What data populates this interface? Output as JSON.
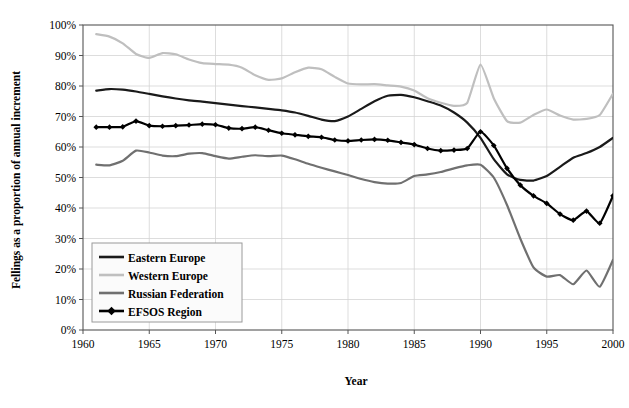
{
  "chart_data": {
    "type": "line",
    "title": "",
    "xlabel": "Year",
    "ylabel": "Fellings as a proportion of annual increment",
    "xlim": [
      1960,
      2000
    ],
    "ylim": [
      0,
      100
    ],
    "xticks": [
      1960,
      1965,
      1970,
      1975,
      1980,
      1985,
      1990,
      1995,
      2000
    ],
    "xtick_labels": [
      "1960",
      "1965",
      "1970",
      "1975",
      "1980",
      "1985",
      "1990",
      "1995",
      "2000"
    ],
    "yticks": [
      0,
      10,
      20,
      30,
      40,
      50,
      60,
      70,
      80,
      90,
      100
    ],
    "ytick_labels": [
      "0%",
      "10%",
      "20%",
      "30%",
      "40%",
      "50%",
      "60%",
      "70%",
      "80%",
      "90%",
      "100%"
    ],
    "grid": "horizontal-and-vertical-light",
    "legend_position": "lower-left-inside",
    "x": [
      1961,
      1962,
      1963,
      1964,
      1965,
      1966,
      1967,
      1968,
      1969,
      1970,
      1971,
      1972,
      1973,
      1974,
      1975,
      1976,
      1977,
      1978,
      1979,
      1980,
      1981,
      1982,
      1983,
      1984,
      1985,
      1986,
      1987,
      1988,
      1989,
      1990,
      1991,
      1992,
      1993,
      1994,
      1995,
      1996,
      1997,
      1998,
      1999,
      2000
    ],
    "series": [
      {
        "name": "Eastern Europe",
        "color": "#1a1a1a",
        "width": 2.2,
        "marker": "none",
        "values": [
          78.5,
          79.0,
          78.8,
          78.2,
          77.4,
          76.6,
          75.9,
          75.3,
          74.9,
          74.4,
          73.9,
          73.4,
          73.0,
          72.5,
          72.0,
          71.3,
          70.2,
          69.0,
          68.5,
          70.0,
          72.5,
          75.0,
          76.8,
          77.1,
          76.3,
          75.0,
          73.6,
          71.3,
          68.0,
          63.0,
          56.0,
          51.0,
          49.2,
          49.0,
          50.5,
          53.5,
          56.5,
          58.0,
          60.0,
          63.0
        ]
      },
      {
        "name": "Western Europe",
        "color": "#bfbfbf",
        "width": 2.2,
        "marker": "none",
        "values": [
          97.0,
          96.2,
          94.0,
          90.5,
          89.2,
          90.8,
          90.4,
          88.7,
          87.5,
          87.2,
          87.0,
          86.0,
          83.5,
          82.0,
          82.5,
          84.5,
          86.0,
          85.5,
          83.0,
          80.8,
          80.5,
          80.6,
          80.2,
          79.8,
          78.5,
          76.0,
          74.5,
          73.5,
          74.5,
          87.0,
          76.0,
          68.5,
          68.0,
          70.5,
          72.3,
          70.3,
          69.0,
          69.2,
          70.5,
          77.5
        ]
      },
      {
        "name": "Russian Federation",
        "color": "#707070",
        "width": 2.2,
        "marker": "none",
        "values": [
          54.2,
          54.0,
          55.5,
          58.8,
          58.2,
          57.2,
          57.0,
          57.8,
          58.0,
          57.0,
          56.2,
          56.8,
          57.3,
          57.0,
          57.2,
          56.0,
          54.5,
          53.2,
          52.0,
          50.8,
          49.5,
          48.5,
          48.0,
          48.2,
          50.5,
          51.0,
          51.8,
          53.0,
          54.0,
          54.2,
          50.0,
          41.0,
          30.0,
          20.5,
          17.5,
          18.0,
          15.0,
          19.5,
          14.2,
          23.0
        ]
      },
      {
        "name": "EFSOS Region",
        "color": "#000000",
        "width": 2.2,
        "marker": "diamond",
        "values": [
          66.5,
          66.5,
          66.6,
          68.5,
          67.0,
          66.8,
          67.0,
          67.2,
          67.5,
          67.3,
          66.2,
          66.0,
          66.5,
          65.5,
          64.5,
          64.0,
          63.5,
          63.2,
          62.3,
          62.0,
          62.3,
          62.5,
          62.2,
          61.5,
          60.8,
          59.5,
          58.8,
          59.0,
          59.5,
          65.0,
          60.5,
          53.0,
          47.5,
          44.0,
          41.5,
          38.0,
          36.0,
          39.0,
          35.0,
          44.0
        ]
      }
    ]
  },
  "axes": {
    "x_title": "Year",
    "y_title": "Fellings as a proportion of annual increment"
  },
  "legend": {
    "entries": [
      {
        "label": "Eastern Europe"
      },
      {
        "label": "Western Europe"
      },
      {
        "label": "Russian Federation"
      },
      {
        "label": "EFSOS Region"
      }
    ]
  }
}
